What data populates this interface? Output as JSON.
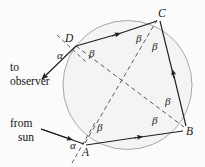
{
  "figure": {
    "name": "inscribed-quadrilateral-rainbow-angle-diagram",
    "background_color": "#fbfbfb",
    "circle_fill": "#f2f2f2",
    "circle_stroke": "#9a9a9a",
    "line_color": "#1f1f1f",
    "dash_color": "#4a4a4a"
  },
  "captions": {
    "observer_line1": "to",
    "observer_line2": "observer",
    "sun_line1": "from",
    "sun_line2": "sun"
  },
  "vertices": [
    {
      "id": "A",
      "label": "A",
      "x": 82,
      "y": 148
    },
    {
      "id": "B",
      "label": "B",
      "x": 186,
      "y": 131
    },
    {
      "id": "C",
      "label": "C",
      "x": 158,
      "y": 14
    },
    {
      "id": "D",
      "label": "D",
      "x": 72,
      "y": 40
    }
  ],
  "angles": [
    {
      "id": "alpha-at-D",
      "label": "α",
      "x": 58,
      "y": 56
    },
    {
      "id": "alpha-at-A",
      "label": "α",
      "x": 71,
      "y": 146
    },
    {
      "id": "beta-at-D",
      "label": "β",
      "x": 91,
      "y": 54
    },
    {
      "id": "beta-at-C-left",
      "label": "β",
      "x": 139,
      "y": 38
    },
    {
      "id": "beta-at-C-right",
      "label": "β",
      "x": 155,
      "y": 46
    },
    {
      "id": "beta-at-B-upper",
      "label": "β",
      "x": 168,
      "y": 101
    },
    {
      "id": "beta-at-B-lower",
      "label": "β",
      "x": 155,
      "y": 120
    },
    {
      "id": "beta-at-A",
      "label": "β",
      "x": 100,
      "y": 128
    }
  ],
  "circle": {
    "cx": 127.5,
    "cy": 85,
    "r": 64.5
  },
  "segments": [
    {
      "id": "side-DC",
      "from": "D",
      "to": "C",
      "style": "solid",
      "arrow": "mid-forward"
    },
    {
      "id": "side-CB",
      "from": "C",
      "to": "B",
      "style": "solid",
      "arrow": "mid-backward"
    },
    {
      "id": "side-AB",
      "from": "A",
      "to": "B",
      "style": "solid",
      "arrow": "mid-forward"
    },
    {
      "id": "diagonal-DB",
      "from": "D",
      "to": "B",
      "style": "dashed",
      "arrow": "none"
    },
    {
      "id": "diagonal-AC",
      "from": "A",
      "to": "C",
      "style": "dashed",
      "arrow": "none"
    }
  ],
  "rays": [
    {
      "id": "ray-to-observer",
      "style": "solid",
      "arrow": "end",
      "from_point": "D",
      "direction": "down-left"
    },
    {
      "id": "ray-from-sun",
      "style": "solid",
      "arrow": "end",
      "to_point": "A",
      "direction": "right"
    }
  ],
  "normals": [
    {
      "id": "normal-at-D",
      "style": "dashed"
    },
    {
      "id": "normal-at-A",
      "style": "dashed"
    }
  ]
}
